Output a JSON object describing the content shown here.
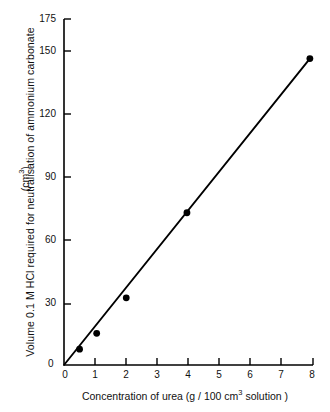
{
  "chart_data": {
    "type": "scatter",
    "title": "",
    "subtitle": "",
    "xlabel": "Concentration of urea (g / 100 cm³ solution)",
    "ylabel": "Volume 0.1 M HCl required for neutralisation of ammonium carbonate",
    "ylabel_units": "(cm³)",
    "xlim": [
      0,
      8
    ],
    "ylim": [
      0,
      175
    ],
    "xticks": [
      0,
      1,
      2,
      3,
      4,
      5,
      6,
      7,
      8
    ],
    "xtick_labels": [
      "0",
      "1",
      "2",
      "3",
      "4",
      "5",
      "6",
      "7",
      "8"
    ],
    "yticks": [
      0,
      30,
      60,
      90,
      120,
      150,
      175
    ],
    "ytick_labels": [
      "0",
      "30",
      "60",
      "90",
      "120",
      "150",
      "175"
    ],
    "grid": false,
    "legend": null,
    "series": [
      {
        "name": "Urea titration",
        "marker": "filled-circle",
        "marker_color": "#000000",
        "line_color": "#000000",
        "line_through_origin": true,
        "x": [
          0.5,
          1.05,
          2.0,
          3.95,
          7.9
        ],
        "y": [
          8,
          16,
          34,
          77,
          155
        ]
      }
    ],
    "fit_line": {
      "from": [
        0,
        0
      ],
      "to": [
        7.9,
        155
      ],
      "slope": 19.6,
      "intercept": 0
    },
    "annotations": []
  },
  "axis": {
    "x_label_text": "Concentration of urea (g / 100 cm",
    "x_label_sup": "3",
    "x_label_tail": " solution )",
    "y_label_text": "Volume 0.1 M HCl required for neutralisation of ammonium carbonate",
    "y_units_prefix": "(cm",
    "y_units_sup": "3",
    "y_units_suffix": ")",
    "origin_label_x": "0",
    "origin_label_y": "0"
  }
}
